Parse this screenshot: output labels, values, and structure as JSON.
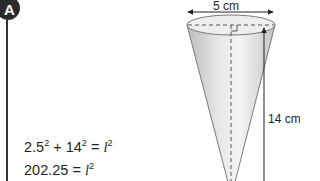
{
  "section": {
    "badge_label": "A"
  },
  "figure": {
    "shape": "cone",
    "diameter_label": "5 cm",
    "height_label": "14 cm",
    "colors": {
      "outline": "#6d6d6d",
      "fill_light": "#f2f2f2",
      "fill_dark": "#bdbdbd",
      "arrow": "#231f20"
    }
  },
  "equations": [
    {
      "lhs_parts": [
        "2.5",
        "2",
        " + 14",
        "2",
        " = "
      ],
      "var": "l",
      "exp": "2",
      "text": "2.5² + 14² = l²"
    },
    {
      "lhs_parts": [
        "202.25",
        " = "
      ],
      "var": "l",
      "exp": "2",
      "text": "202.25 = l²"
    }
  ]
}
